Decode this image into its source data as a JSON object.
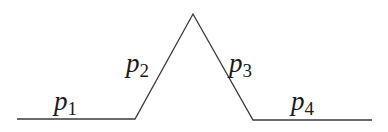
{
  "diagram": {
    "stroke_color": "#3a3a3a",
    "path_points": [
      [
        17,
        119
      ],
      [
        135,
        119
      ],
      [
        193,
        14
      ],
      [
        253,
        120
      ],
      [
        372,
        120
      ]
    ],
    "labels": [
      {
        "base": "p",
        "sub": "1",
        "x": 54,
        "y": 110
      },
      {
        "base": "p",
        "sub": "2",
        "x": 126,
        "y": 72
      },
      {
        "base": "p",
        "sub": "3",
        "x": 229,
        "y": 72
      },
      {
        "base": "p",
        "sub": "4",
        "x": 291,
        "y": 110
      }
    ]
  }
}
